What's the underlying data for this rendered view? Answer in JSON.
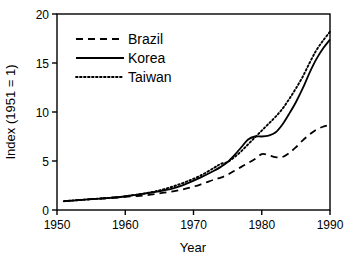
{
  "chart_data": {
    "type": "line",
    "title": "",
    "xlabel": "Year",
    "ylabel": "Index (1951 = 1)",
    "xlim": [
      1950,
      1990
    ],
    "ylim": [
      0,
      20
    ],
    "xticks": [
      1950,
      1960,
      1970,
      1980,
      1990
    ],
    "yticks": [
      0,
      5,
      10,
      15,
      20
    ],
    "xtick_labels": [
      "1950",
      "1960",
      "1970",
      "1980",
      "1990"
    ],
    "ytick_labels": [
      "0",
      "5",
      "10",
      "15",
      "20"
    ],
    "grid": false,
    "legend_position": "upper left",
    "x": [
      1951,
      1953,
      1955,
      1957,
      1959,
      1961,
      1963,
      1965,
      1967,
      1969,
      1971,
      1973,
      1974,
      1975,
      1976,
      1977,
      1978,
      1979,
      1980,
      1981,
      1982,
      1983,
      1984,
      1985,
      1986,
      1987,
      1988,
      1989,
      1990
    ],
    "series": [
      {
        "name": "Brazil",
        "style": "dashed",
        "values": [
          0.9,
          1.0,
          1.1,
          1.2,
          1.3,
          1.4,
          1.5,
          1.7,
          1.9,
          2.2,
          2.6,
          3.1,
          3.3,
          3.6,
          4.0,
          4.4,
          4.8,
          5.2,
          5.7,
          5.6,
          5.4,
          5.4,
          5.8,
          6.4,
          7.1,
          7.7,
          8.2,
          8.5,
          8.7
        ]
      },
      {
        "name": "Korea",
        "style": "solid",
        "values": [
          0.9,
          1.0,
          1.1,
          1.2,
          1.3,
          1.5,
          1.7,
          1.9,
          2.2,
          2.7,
          3.3,
          4.0,
          4.4,
          4.9,
          5.6,
          6.4,
          7.2,
          7.5,
          7.5,
          7.6,
          7.9,
          8.7,
          9.8,
          11.0,
          12.4,
          14.0,
          15.4,
          16.5,
          17.4
        ]
      },
      {
        "name": "Taiwan",
        "style": "dotted",
        "values": [
          0.9,
          1.0,
          1.1,
          1.2,
          1.3,
          1.5,
          1.7,
          2.0,
          2.4,
          2.9,
          3.5,
          4.3,
          4.7,
          4.9,
          5.4,
          6.0,
          6.7,
          7.4,
          8.1,
          8.8,
          9.5,
          10.3,
          11.3,
          12.4,
          13.6,
          15.0,
          16.3,
          17.3,
          18.2
        ]
      }
    ],
    "legend_entries": [
      "Brazil",
      "Korea",
      "Taiwan"
    ],
    "colors": {
      "axis": "#000000",
      "brazil": "#000000",
      "korea": "#000000",
      "taiwan": "#000000",
      "background": "#ffffff"
    }
  },
  "axes": {
    "x_title": "Year",
    "y_title": "Index (1951 = 1)"
  },
  "legend": {
    "items": [
      {
        "label": "Brazil",
        "style": "dashed"
      },
      {
        "label": "Korea",
        "style": "solid"
      },
      {
        "label": "Taiwan",
        "style": "dotted"
      }
    ]
  }
}
